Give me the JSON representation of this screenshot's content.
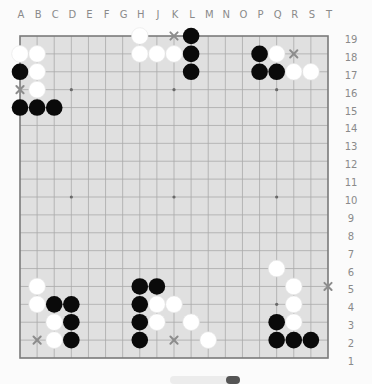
{
  "board": {
    "size": 19,
    "columns": [
      "A",
      "B",
      "C",
      "D",
      "E",
      "F",
      "G",
      "H",
      "J",
      "K",
      "L",
      "M",
      "N",
      "O",
      "P",
      "Q",
      "R",
      "S",
      "T"
    ],
    "rows": [
      "19",
      "18",
      "17",
      "16",
      "15",
      "14",
      "13",
      "12",
      "11",
      "10",
      "9",
      "8",
      "7",
      "6",
      "5",
      "4",
      "3",
      "2",
      "1"
    ],
    "star_points": [
      "D16",
      "K16",
      "Q16",
      "D10",
      "K10",
      "Q10",
      "D4",
      "K4",
      "Q4"
    ],
    "colors": {
      "board_fill": "#e0e0e0",
      "grid_line": "#a9a9a9",
      "border_line": "#7a7a7a",
      "black_stone": "#0a0a0a",
      "white_stone": "#ffffff",
      "marker": "#8c8c8c",
      "label": "#8a8a8a"
    },
    "black_stones": [
      "L19",
      "P18",
      "L18",
      "A17",
      "L17",
      "P17",
      "Q17",
      "A15",
      "B15",
      "C15",
      "H5",
      "J5",
      "C4",
      "D4",
      "H4",
      "D3",
      "H3",
      "Q3",
      "D2",
      "H2",
      "Q2",
      "R2",
      "S2"
    ],
    "white_stones": [
      "H19",
      "A18",
      "B18",
      "H18",
      "J18",
      "K18",
      "Q18",
      "B17",
      "R17",
      "S17",
      "B16",
      "Q6",
      "B5",
      "R5",
      "B4",
      "J4",
      "K4",
      "R4",
      "C3",
      "J3",
      "L3",
      "R3",
      "C2",
      "M2"
    ],
    "x_markers": [
      "K19",
      "R18",
      "A16",
      "T5",
      "B2",
      "K2"
    ]
  }
}
